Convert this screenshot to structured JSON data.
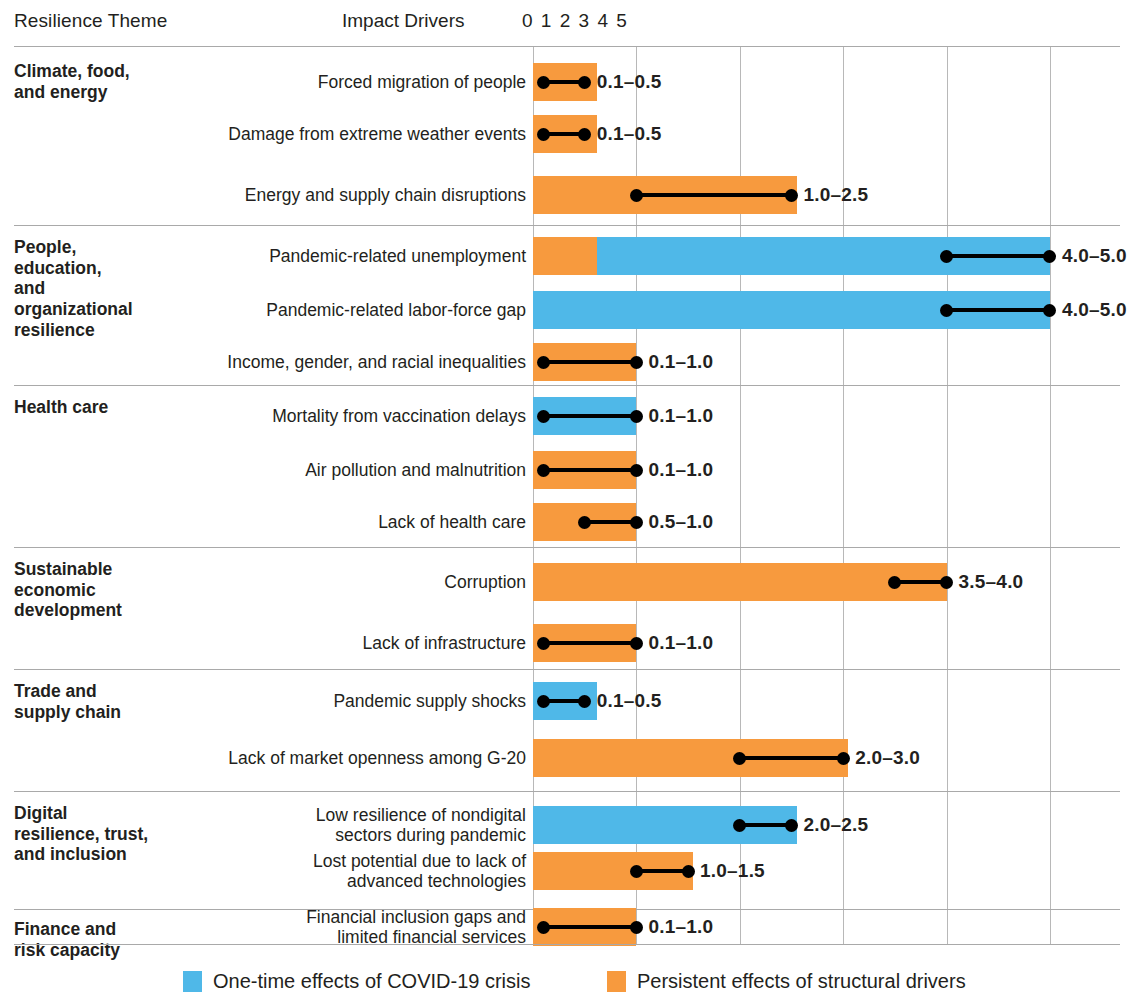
{
  "header": {
    "theme_column": "Resilience Theme",
    "drivers_column": "Impact Drivers",
    "tick_string": "0 1 2 3 4 5"
  },
  "axis": {
    "ticks": [
      "0",
      "1",
      "2",
      "3",
      "4",
      "5"
    ],
    "min": 0,
    "max": 5
  },
  "colors": {
    "one_time": "#4FB8E8",
    "persistent": "#F79A3E",
    "gridline": "#b8b8b8",
    "rule": "#a9a9a9",
    "text": "#231f20"
  },
  "legend": [
    {
      "label": "One-time effects of COVID-19 crisis",
      "color_key": "one_time"
    },
    {
      "label": "Persistent effects of structural drivers",
      "color_key": "persistent"
    }
  ],
  "chart_data": {
    "type": "bar",
    "title": "",
    "xlabel": "Impact Drivers",
    "ylabel": "Resilience Theme",
    "xlim": [
      0,
      5
    ],
    "grid": true,
    "legend_position": "bottom",
    "groups": [
      {
        "theme": "Climate, food,\nand energy",
        "rows": [
          {
            "label": "Forced migration of people",
            "bar_start": 0,
            "bar_end": 0.62,
            "bar_color": "persistent",
            "segments": [
              {
                "from": 0,
                "to": 0.62,
                "color": "persistent"
              }
            ],
            "range_low": 0.1,
            "range_high": 0.5,
            "range_label": "0.1–0.5"
          },
          {
            "label": "Damage from extreme weather events",
            "bar_start": 0,
            "bar_end": 0.62,
            "bar_color": "persistent",
            "segments": [
              {
                "from": 0,
                "to": 0.62,
                "color": "persistent"
              }
            ],
            "range_low": 0.1,
            "range_high": 0.5,
            "range_label": "0.1–0.5"
          },
          {
            "label": "Energy and supply chain disruptions",
            "bar_start": 0,
            "bar_end": 2.55,
            "bar_color": "persistent",
            "segments": [
              {
                "from": 0,
                "to": 2.55,
                "color": "persistent"
              }
            ],
            "range_low": 1.0,
            "range_high": 2.5,
            "range_label": "1.0–2.5"
          }
        ]
      },
      {
        "theme": "People,\neducation,\nand\norganizational\nresilience",
        "rows": [
          {
            "label": "Pandemic-related unemployment",
            "bar_start": 0,
            "bar_end": 5.0,
            "bar_color": "one_time",
            "segments": [
              {
                "from": 0,
                "to": 0.62,
                "color": "persistent"
              },
              {
                "from": 0.62,
                "to": 5.0,
                "color": "one_time"
              }
            ],
            "range_low": 4.0,
            "range_high": 5.0,
            "range_label": "4.0–5.0"
          },
          {
            "label": "Pandemic-related labor-force gap",
            "bar_start": 0,
            "bar_end": 5.0,
            "bar_color": "one_time",
            "segments": [
              {
                "from": 0,
                "to": 5.0,
                "color": "one_time"
              }
            ],
            "range_low": 4.0,
            "range_high": 5.0,
            "range_label": "4.0–5.0"
          },
          {
            "label": "Income, gender, and racial inequalities",
            "bar_start": 0,
            "bar_end": 1.0,
            "bar_color": "persistent",
            "segments": [
              {
                "from": 0,
                "to": 1.0,
                "color": "persistent"
              }
            ],
            "range_low": 0.1,
            "range_high": 1.0,
            "range_label": "0.1–1.0"
          }
        ]
      },
      {
        "theme": "Health care",
        "rows": [
          {
            "label": "Mortality from vaccination delays",
            "bar_start": 0,
            "bar_end": 1.0,
            "bar_color": "one_time",
            "segments": [
              {
                "from": 0,
                "to": 1.0,
                "color": "one_time"
              }
            ],
            "range_low": 0.1,
            "range_high": 1.0,
            "range_label": "0.1–1.0"
          },
          {
            "label": "Air pollution and malnutrition",
            "bar_start": 0,
            "bar_end": 1.0,
            "bar_color": "persistent",
            "segments": [
              {
                "from": 0,
                "to": 1.0,
                "color": "persistent"
              }
            ],
            "range_low": 0.1,
            "range_high": 1.0,
            "range_label": "0.1–1.0"
          },
          {
            "label": "Lack of health care",
            "bar_start": 0,
            "bar_end": 1.0,
            "bar_color": "persistent",
            "segments": [
              {
                "from": 0,
                "to": 1.0,
                "color": "persistent"
              }
            ],
            "range_low": 0.5,
            "range_high": 1.0,
            "range_label": "0.5–1.0"
          }
        ]
      },
      {
        "theme": "Sustainable\neconomic\ndevelopment",
        "rows": [
          {
            "label": "Corruption",
            "bar_start": 0,
            "bar_end": 4.0,
            "bar_color": "persistent",
            "segments": [
              {
                "from": 0,
                "to": 4.0,
                "color": "persistent"
              }
            ],
            "range_low": 3.5,
            "range_high": 4.0,
            "range_label": "3.5–4.0"
          },
          {
            "label": "Lack of infrastructure",
            "bar_start": 0,
            "bar_end": 1.0,
            "bar_color": "persistent",
            "segments": [
              {
                "from": 0,
                "to": 1.0,
                "color": "persistent"
              }
            ],
            "range_low": 0.1,
            "range_high": 1.0,
            "range_label": "0.1–1.0"
          }
        ]
      },
      {
        "theme": "Trade and\nsupply chain",
        "rows": [
          {
            "label": "Pandemic supply shocks",
            "bar_start": 0,
            "bar_end": 0.62,
            "bar_color": "one_time",
            "segments": [
              {
                "from": 0,
                "to": 0.62,
                "color": "one_time"
              }
            ],
            "range_low": 0.1,
            "range_high": 0.5,
            "range_label": "0.1–0.5"
          },
          {
            "label": "Lack of market openness among G-20",
            "bar_start": 0,
            "bar_end": 3.05,
            "bar_color": "persistent",
            "segments": [
              {
                "from": 0,
                "to": 3.05,
                "color": "persistent"
              }
            ],
            "range_low": 2.0,
            "range_high": 3.0,
            "range_label": "2.0–3.0"
          }
        ]
      },
      {
        "theme": "Digital\nresilience, trust,\nand inclusion",
        "rows": [
          {
            "label": "Low resilience of nondigital\nsectors during pandemic",
            "bar_start": 0,
            "bar_end": 2.55,
            "bar_color": "one_time",
            "segments": [
              {
                "from": 0,
                "to": 2.55,
                "color": "one_time"
              }
            ],
            "range_low": 2.0,
            "range_high": 2.5,
            "range_label": "2.0–2.5"
          },
          {
            "label": "Lost potential due to lack of\nadvanced technologies",
            "bar_start": 0,
            "bar_end": 1.55,
            "bar_color": "persistent",
            "segments": [
              {
                "from": 0,
                "to": 1.55,
                "color": "persistent"
              }
            ],
            "range_low": 1.0,
            "range_high": 1.5,
            "range_label": "1.0–1.5"
          }
        ]
      },
      {
        "theme": "Finance and\nrisk capacity",
        "rows": [
          {
            "label": "Financial inclusion gaps and\nlimited financial services",
            "bar_start": 0,
            "bar_end": 1.0,
            "bar_color": "persistent",
            "segments": [
              {
                "from": 0,
                "to": 1.0,
                "color": "persistent"
              }
            ],
            "range_low": 0.1,
            "range_high": 1.0,
            "range_label": "0.1–1.0"
          }
        ]
      }
    ]
  }
}
